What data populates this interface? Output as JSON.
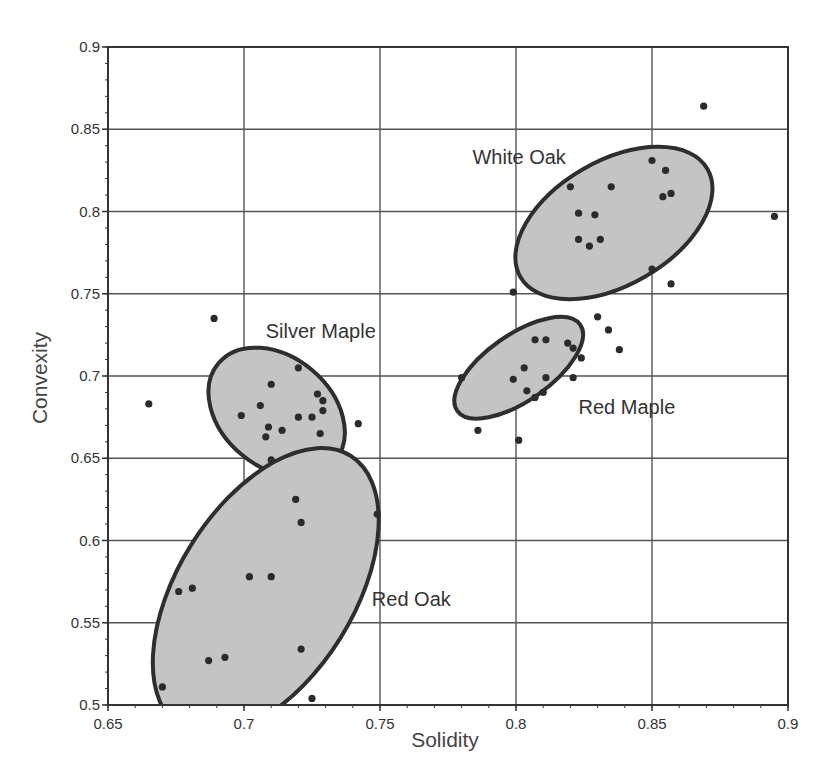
{
  "chart_data": {
    "type": "scatter",
    "title": "",
    "xlabel": "Solidity",
    "ylabel": "Convexity",
    "xlim": [
      0.65,
      0.9
    ],
    "ylim": [
      0.5,
      0.9
    ],
    "xticks": [
      0.65,
      0.7,
      0.75,
      0.8,
      0.85,
      0.9
    ],
    "xtick_labels": [
      "0.65",
      "0.7",
      "0.75",
      "0.8",
      "0.85",
      "0.9"
    ],
    "yticks": [
      0.5,
      0.55,
      0.6,
      0.65,
      0.7,
      0.75,
      0.8,
      0.85,
      0.9
    ],
    "ytick_labels": [
      "0.5",
      "0.55",
      "0.6",
      "0.65",
      "0.7",
      "0.75",
      "0.8",
      "0.85",
      "0.9"
    ],
    "minor_tick_step": 0.01,
    "grid": true,
    "legend": null,
    "clusters": [
      {
        "name": "White Oak",
        "label_pos": {
          "x": 0.784,
          "y": 0.829
        },
        "ellipse": {
          "cx": 0.836,
          "cy": 0.793,
          "rx_px": 108,
          "ry_px": 62,
          "angle_deg": -30
        },
        "fill": "#c4c4c4"
      },
      {
        "name": "Red Maple",
        "label_pos": {
          "x": 0.823,
          "y": 0.677
        },
        "ellipse": {
          "cx": 0.801,
          "cy": 0.705,
          "rx_px": 75,
          "ry_px": 33,
          "angle_deg": -35
        },
        "fill": "#c4c4c4"
      },
      {
        "name": "Silver Maple",
        "label_pos": {
          "x": 0.708,
          "y": 0.723
        },
        "ellipse": {
          "cx": 0.712,
          "cy": 0.678,
          "rx_px": 76,
          "ry_px": 55,
          "angle_deg": 40
        },
        "fill": "#c4c4c4"
      },
      {
        "name": "Red Oak",
        "label_pos": {
          "x": 0.747,
          "y": 0.56
        },
        "ellipse": {
          "cx": 0.708,
          "cy": 0.569,
          "rx_px": 160,
          "ry_px": 88,
          "angle_deg": -58
        },
        "fill": "#c4c4c4"
      }
    ],
    "series": [
      {
        "name": "points",
        "points": [
          {
            "x": 0.869,
            "y": 0.864
          },
          {
            "x": 0.85,
            "y": 0.831
          },
          {
            "x": 0.855,
            "y": 0.825
          },
          {
            "x": 0.82,
            "y": 0.815
          },
          {
            "x": 0.835,
            "y": 0.815
          },
          {
            "x": 0.857,
            "y": 0.811
          },
          {
            "x": 0.854,
            "y": 0.809
          },
          {
            "x": 0.823,
            "y": 0.799
          },
          {
            "x": 0.829,
            "y": 0.798
          },
          {
            "x": 0.895,
            "y": 0.797
          },
          {
            "x": 0.823,
            "y": 0.783
          },
          {
            "x": 0.831,
            "y": 0.783
          },
          {
            "x": 0.827,
            "y": 0.779
          },
          {
            "x": 0.85,
            "y": 0.765
          },
          {
            "x": 0.857,
            "y": 0.756
          },
          {
            "x": 0.799,
            "y": 0.751
          },
          {
            "x": 0.83,
            "y": 0.736
          },
          {
            "x": 0.834,
            "y": 0.728
          },
          {
            "x": 0.807,
            "y": 0.722
          },
          {
            "x": 0.811,
            "y": 0.722
          },
          {
            "x": 0.819,
            "y": 0.72
          },
          {
            "x": 0.821,
            "y": 0.717
          },
          {
            "x": 0.838,
            "y": 0.716
          },
          {
            "x": 0.824,
            "y": 0.711
          },
          {
            "x": 0.803,
            "y": 0.705
          },
          {
            "x": 0.78,
            "y": 0.699
          },
          {
            "x": 0.799,
            "y": 0.698
          },
          {
            "x": 0.811,
            "y": 0.699
          },
          {
            "x": 0.821,
            "y": 0.699
          },
          {
            "x": 0.804,
            "y": 0.691
          },
          {
            "x": 0.81,
            "y": 0.69
          },
          {
            "x": 0.807,
            "y": 0.687
          },
          {
            "x": 0.786,
            "y": 0.667
          },
          {
            "x": 0.801,
            "y": 0.661
          },
          {
            "x": 0.689,
            "y": 0.735
          },
          {
            "x": 0.72,
            "y": 0.705
          },
          {
            "x": 0.71,
            "y": 0.695
          },
          {
            "x": 0.727,
            "y": 0.689
          },
          {
            "x": 0.729,
            "y": 0.685
          },
          {
            "x": 0.706,
            "y": 0.682
          },
          {
            "x": 0.729,
            "y": 0.679
          },
          {
            "x": 0.665,
            "y": 0.683
          },
          {
            "x": 0.699,
            "y": 0.676
          },
          {
            "x": 0.72,
            "y": 0.675
          },
          {
            "x": 0.725,
            "y": 0.675
          },
          {
            "x": 0.742,
            "y": 0.671
          },
          {
            "x": 0.709,
            "y": 0.669
          },
          {
            "x": 0.714,
            "y": 0.667
          },
          {
            "x": 0.708,
            "y": 0.663
          },
          {
            "x": 0.728,
            "y": 0.665
          },
          {
            "x": 0.71,
            "y": 0.649
          },
          {
            "x": 0.719,
            "y": 0.625
          },
          {
            "x": 0.749,
            "y": 0.616
          },
          {
            "x": 0.721,
            "y": 0.611
          },
          {
            "x": 0.702,
            "y": 0.578
          },
          {
            "x": 0.71,
            "y": 0.578
          },
          {
            "x": 0.681,
            "y": 0.571
          },
          {
            "x": 0.676,
            "y": 0.569
          },
          {
            "x": 0.721,
            "y": 0.534
          },
          {
            "x": 0.693,
            "y": 0.529
          },
          {
            "x": 0.687,
            "y": 0.527
          },
          {
            "x": 0.67,
            "y": 0.511
          },
          {
            "x": 0.725,
            "y": 0.504
          }
        ]
      }
    ]
  },
  "styles": {
    "point_color": "#2b2b2b",
    "ellipse_fill": "#c4c4c4",
    "ellipse_stroke": "#2e2e2e",
    "grid_color": "#555555",
    "axis_color": "#333333"
  }
}
